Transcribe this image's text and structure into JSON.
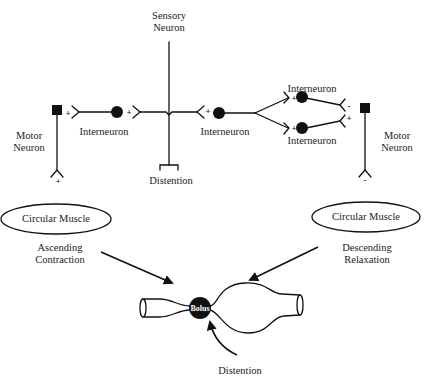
{
  "diagram": {
    "title": "",
    "labels": {
      "sensory_neuron": [
        "Sensory",
        "Neuron"
      ],
      "distention_top": "Distention",
      "motor_neuron_left": [
        "Motor",
        "Neuron"
      ],
      "motor_neuron_right": [
        "Motor",
        "Neuron"
      ],
      "interneuron_left": "Interneuron",
      "interneuron_center_right": "Interneuron",
      "interneuron_upper_right": "Interneuron",
      "interneuron_lower_right": "Interneuron",
      "circular_muscle_left": "Circular Muscle",
      "circular_muscle_right": "Circular Muscle",
      "ascending_contraction": [
        "Ascending",
        "Contraction"
      ],
      "descending_relaxation": [
        "Descending",
        "Relaxation"
      ],
      "bolus": "Bolus",
      "distention_bottom": "Distention"
    },
    "synapse_signs": {
      "motor_left_input": "+",
      "interneuron_left_input": "+",
      "sensory_left_output": "+",
      "sensory_right_output": "+",
      "interneuron_upper_input": "+",
      "interneuron_lower_input": "+",
      "motor_right_from_upper": "-",
      "motor_right_from_lower": "+",
      "motor_left_output": "+",
      "motor_right_output": "-"
    },
    "colors": {
      "ink": "#111111",
      "background": "#ffffff"
    }
  }
}
